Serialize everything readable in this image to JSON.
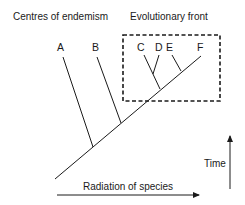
{
  "headings": {
    "left": "Centres of endemism",
    "right": "Evolutionary front"
  },
  "species": [
    {
      "id": "A",
      "label": "A"
    },
    {
      "id": "B",
      "label": "B"
    },
    {
      "id": "C",
      "label": "C"
    },
    {
      "id": "D",
      "label": "D"
    },
    {
      "id": "E",
      "label": "E"
    },
    {
      "id": "F",
      "label": "F"
    }
  ],
  "axes": {
    "x_label": "Radiation of species",
    "y_label": "Time"
  },
  "colors": {
    "ink": "#1a1a1a",
    "background": "#ffffff"
  }
}
